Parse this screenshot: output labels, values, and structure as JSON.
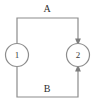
{
  "diagram": {
    "type": "directed-graph",
    "background_color": "#ffffff",
    "line_color": "#8c8c8c",
    "text_color": "#2e2e2e",
    "nodes": [
      {
        "id": "node-1",
        "label": "1",
        "cx": 17,
        "cy": 55,
        "r": 11.5
      },
      {
        "id": "node-2",
        "label": "2",
        "cx": 78,
        "cy": 55,
        "r": 11.5
      }
    ],
    "edges": [
      {
        "id": "edge-a",
        "label": "A",
        "from": "node-1",
        "to": "node-2",
        "route": "top",
        "label_x": 47,
        "label_y": 10,
        "arrow": "into-node-2-from-above"
      },
      {
        "id": "edge-b",
        "label": "B",
        "from": "node-1",
        "to": "node-2",
        "route": "bottom",
        "label_x": 47,
        "label_y": 90,
        "arrow": "into-node-2-from-below"
      }
    ]
  }
}
